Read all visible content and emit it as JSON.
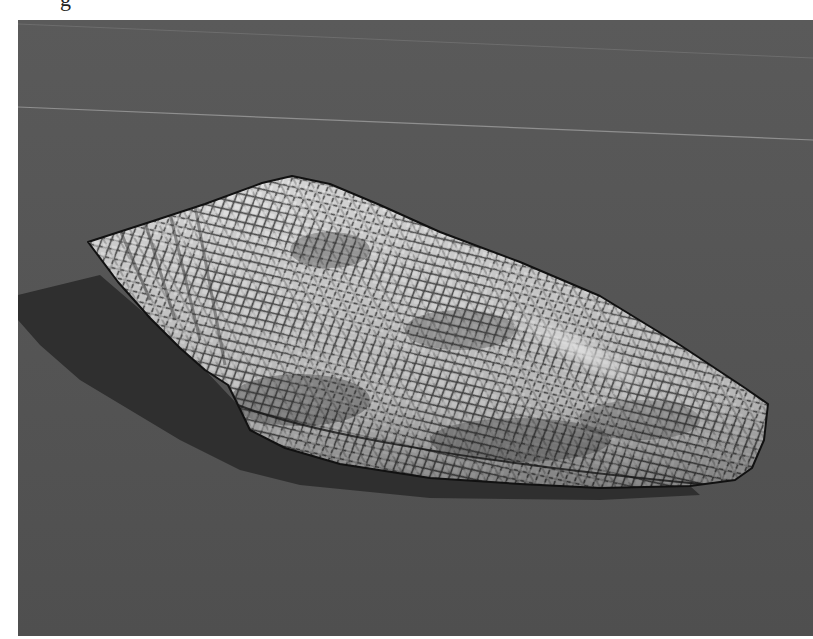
{
  "caption_fragment": "g",
  "photo": {
    "subject": "cone shell",
    "description": "Grayscale photograph of a textile-patterned cone shell lying on a gray surface with a shadow to its lower left",
    "colors": {
      "background": "#535353",
      "background_light": "#5c5c5c",
      "shadow": "#2e2e2e",
      "shell_base": "#cfcfcf",
      "shell_mesh": "#3a3a3a",
      "outline": "#111111",
      "line": "#8a8a8a"
    }
  }
}
